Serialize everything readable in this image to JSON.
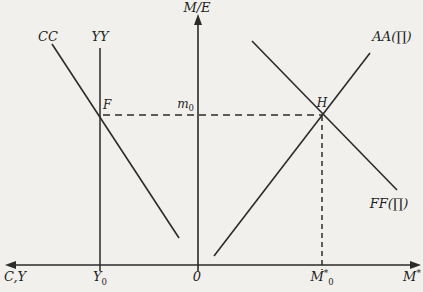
{
  "figure": {
    "background_color": "#f1f0ec",
    "line_color": "#2b2b2b",
    "labels": {
      "vertical_axis": "M/E",
      "cc_curve": "CC",
      "yy_curve": "YY",
      "point_f": "F",
      "m0": {
        "main": "m",
        "sub": "0"
      },
      "point_h": "H",
      "aa_curve": "AA(∏)",
      "ff_curve": "FF(∏)",
      "horizontal_axis_left": "C,Y",
      "y0": {
        "main": "Y",
        "sub": "0"
      },
      "origin": "0",
      "mstar0": {
        "main": "M",
        "sup": "*",
        "sub": "0"
      },
      "horizontal_axis_right": {
        "main": "M",
        "sup": "*"
      }
    }
  }
}
